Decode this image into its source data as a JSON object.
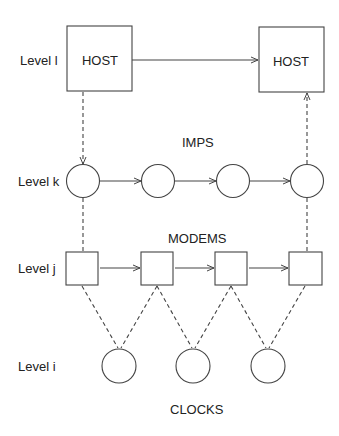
{
  "levels": {
    "l": "Level l",
    "k": "Level k",
    "j": "Level j",
    "i": "Level i"
  },
  "nodes": {
    "host_left": "HOST",
    "host_right": "HOST"
  },
  "group_labels": {
    "imps": "IMPS",
    "modems": "MODEMS",
    "clocks": "CLOCKS"
  },
  "colors": {
    "stroke": "#444444",
    "text": "#222222",
    "background": "#ffffff"
  }
}
